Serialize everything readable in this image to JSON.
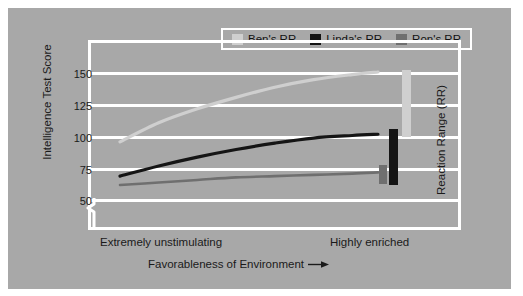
{
  "figure": {
    "panel_color": "#a8a8a8",
    "frame_color": "#ffffff",
    "background": "#ffffff"
  },
  "legend": {
    "position": "top-center",
    "entries": [
      {
        "label": "Ben's RR",
        "color": "#cfcfcf",
        "name": "Ben"
      },
      {
        "label": "Linda's RR",
        "color": "#151515",
        "name": "Linda"
      },
      {
        "label": "Ron's RR",
        "color": "#6f6f6f",
        "name": "Ron"
      }
    ]
  },
  "axes": {
    "y_title": "Intelligence Test Score",
    "y_ticks": [
      "150",
      "125",
      "100",
      "75",
      "50"
    ],
    "y_break": true,
    "x_title": "Favorableness of Environment",
    "x_arrow": "→",
    "x_left_label": "Extremely unstimulating",
    "x_right_label": "Highly enriched",
    "right_title": "Reaction Range (RR)"
  },
  "chart_data": {
    "type": "line",
    "title": "",
    "xlabel": "Favorableness of Environment",
    "ylabel": "Intelligence Test Score",
    "ylim": [
      50,
      158
    ],
    "yticks": [
      50,
      75,
      100,
      125,
      150
    ],
    "xlim": [
      "Extremely unstimulating",
      "Highly enriched"
    ],
    "grid": true,
    "axis_break_below": 50,
    "legend_position": "top-center",
    "series": [
      {
        "name": "Ben's RR",
        "color": "#cfcfcf",
        "x": [
          0.0,
          0.15,
          0.3,
          0.45,
          0.6,
          0.75,
          0.9,
          1.0
        ],
        "values": [
          95,
          110,
          121,
          130,
          138,
          144,
          148,
          150
        ],
        "reaction_range": [
          95,
          150
        ]
      },
      {
        "name": "Linda's RR",
        "color": "#151515",
        "x": [
          0.0,
          0.15,
          0.3,
          0.45,
          0.6,
          0.75,
          0.9,
          1.0
        ],
        "values": [
          68,
          76,
          83,
          89,
          94,
          98,
          100,
          101
        ],
        "reaction_range": [
          68,
          101
        ]
      },
      {
        "name": "Ron's RR",
        "color": "#6f6f6f",
        "x": [
          0.0,
          0.15,
          0.3,
          0.45,
          0.6,
          0.75,
          0.9,
          1.0
        ],
        "values": [
          61,
          63,
          65,
          67,
          68,
          69,
          70,
          71
        ],
        "reaction_range": [
          61,
          71
        ]
      }
    ],
    "rr_bars": [
      {
        "name": "Ron's RR",
        "color": "#6f6f6f",
        "low": 61,
        "high": 71
      },
      {
        "name": "Linda's RR",
        "color": "#151515",
        "low": 68,
        "high": 101
      },
      {
        "name": "Ben's RR",
        "color": "#cfcfcf",
        "low": 95,
        "high": 150
      }
    ]
  }
}
